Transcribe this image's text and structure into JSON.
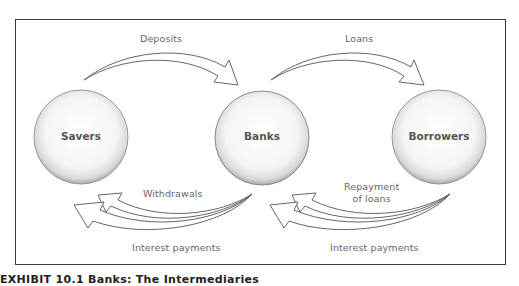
{
  "diagram": {
    "nodes": [
      {
        "id": "savers",
        "label": "Savers"
      },
      {
        "id": "banks",
        "label": "Banks"
      },
      {
        "id": "borrowers",
        "label": "Borrowers"
      }
    ],
    "flows": {
      "deposits": "Deposits",
      "loans": "Loans",
      "withdrawals": "Withdrawals",
      "interest_left": "Interest payments",
      "repayment": "Repayment of loans",
      "repayment_line1": "Repayment",
      "repayment_line2": "of loans",
      "interest_right": "Interest payments"
    },
    "edges": [
      {
        "from": "savers",
        "to": "banks",
        "label": "Deposits"
      },
      {
        "from": "banks",
        "to": "borrowers",
        "label": "Loans"
      },
      {
        "from": "banks",
        "to": "savers",
        "label": "Withdrawals"
      },
      {
        "from": "banks",
        "to": "savers",
        "label": "Interest payments"
      },
      {
        "from": "borrowers",
        "to": "banks",
        "label": "Repayment of loans"
      },
      {
        "from": "borrowers",
        "to": "banks",
        "label": "Interest payments"
      }
    ]
  },
  "caption": "EXHIBIT 10.1  Banks: The Intermediaries"
}
